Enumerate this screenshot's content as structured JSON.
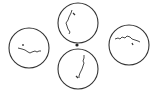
{
  "diagram": {
    "stroke_color": "#333333",
    "background": "#ffffff",
    "center_dot": {
      "cx": 77,
      "cy": 45,
      "r": 1.6
    },
    "circles": [
      {
        "name": "top",
        "cx": 78,
        "cy": 23,
        "r": 20,
        "line": "M72,10 L71,13 L70,15 L69,17 L68,20 L66,23 L67,26 L68,29 L70,32 L69,34",
        "mark": "M73,13 L75,15"
      },
      {
        "name": "bottom",
        "cx": 78,
        "cy": 69,
        "r": 20,
        "line": "M84,55 L84,58 L83,61 L84,63 L83,66 L82,69 L81,71 L80,73 L79,76 L79,78",
        "mark": "M76,76 L78,78"
      },
      {
        "name": "left",
        "cx": 29,
        "cy": 48,
        "r": 20,
        "line": "M18,48 L22,49 L25,50 L28,52 L30,53 L32,52 L35,51 L37,52 L39,51 L41,51",
        "mark": "M23,44 L23,46"
      },
      {
        "name": "right",
        "cx": 129,
        "cy": 45,
        "r": 20,
        "line": "M115,39 L118,38 L120,39 L122,37 L125,38 L127,36 L130,37 L132,39 L135,40 L138,41 L140,42",
        "mark": "M132,43 L133,45"
      }
    ]
  }
}
